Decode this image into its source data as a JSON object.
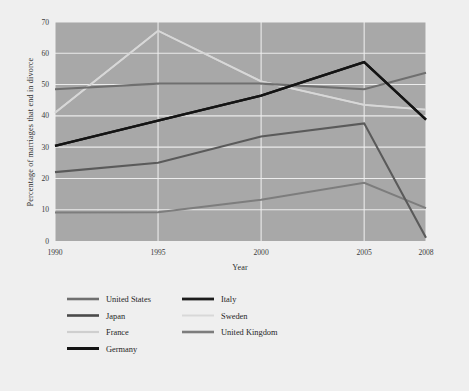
{
  "chart_data": {
    "type": "line",
    "title": "",
    "xlabel": "Year",
    "ylabel": "Percentage of marriages that end in divorce",
    "x": [
      1990,
      1995,
      2000,
      2005,
      2008
    ],
    "tick_labels_x": [
      "1990",
      "1995",
      "2000",
      "2005",
      "2008"
    ],
    "tick_labels_y": [
      "0",
      "10",
      "20",
      "30",
      "40",
      "50",
      "60",
      "70"
    ],
    "ylim": [
      0,
      70
    ],
    "yticks": [
      0,
      10,
      20,
      30,
      40,
      50,
      60,
      70
    ],
    "grid": true,
    "legend_position": "below",
    "plot_background": "#a8a8a8",
    "figure_background": "#efefef",
    "series": [
      {
        "name": "United States",
        "color": "#6f6f6f",
        "width": 2.1,
        "values": [
          48.5,
          50.3,
          50.3,
          48.5,
          53.8
        ]
      },
      {
        "name": "Japan",
        "color": "#5a5a5a",
        "width": 2.1,
        "values": [
          22.0,
          25.0,
          33.4,
          37.6,
          1.0
        ]
      },
      {
        "name": "France",
        "color": "#cfcfcf",
        "width": 1.9,
        "values": [
          41.0,
          67.2,
          51.0,
          43.5,
          42.0
        ]
      },
      {
        "name": "Germany",
        "color": "#141414",
        "width": 2.3,
        "values": [
          30.4,
          38.5,
          46.5,
          57.2,
          38.8
        ]
      },
      {
        "name": "Italy",
        "color": "#1c1c1c",
        "width": 2.3,
        "values": [
          30.4,
          38.5,
          46.5,
          57.2,
          38.8
        ]
      },
      {
        "name": "Sweden",
        "color": "#d8d8d8",
        "width": 1.9,
        "values": [
          41.0,
          67.2,
          51.0,
          43.5,
          42.0
        ]
      },
      {
        "name": "United Kingdom",
        "color": "#7d7d7d",
        "width": 2.1,
        "values": [
          9.1,
          9.2,
          13.2,
          18.6,
          10.5
        ]
      }
    ],
    "legend": {
      "columns": [
        [
          {
            "label": "United States",
            "color": "#6f6f6f",
            "width": 2.6
          },
          {
            "label": "Japan",
            "color": "#4a4a4a",
            "width": 2.6
          },
          {
            "label": "France",
            "color": "#cfcfcf",
            "width": 2.2
          },
          {
            "label": "Germany",
            "color": "#141414",
            "width": 3.0
          }
        ],
        [
          {
            "label": "Italy",
            "color": "#1c1c1c",
            "width": 2.8
          },
          {
            "label": "Sweden",
            "color": "#d8d8d8",
            "width": 2.0
          },
          {
            "label": "United Kingdom",
            "color": "#7d7d7d",
            "width": 2.6
          }
        ]
      ]
    }
  }
}
